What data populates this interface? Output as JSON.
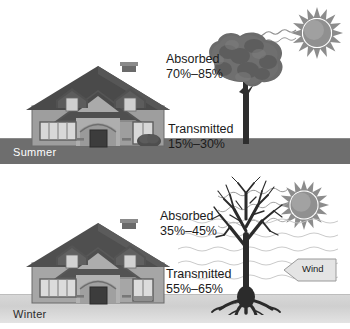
{
  "figure": {
    "type": "illustration"
  },
  "panels": [
    {
      "id": "summer",
      "season_label": "Summer",
      "ground_color": "#6e6e6e",
      "season_label_color": "#ffffff",
      "tree_state": "leafed",
      "callouts": [
        {
          "name": "absorbed",
          "line1": "Absorbed",
          "line2": "70%–85%"
        },
        {
          "name": "transmitted",
          "line1": "Transmitted",
          "line2": "15%–30%"
        }
      ],
      "sun": {
        "name": "sun-icon",
        "color": "#8c8c8c"
      },
      "shrub": true,
      "wind": null
    },
    {
      "id": "winter",
      "season_label": "Winter",
      "ground_color": "#d4d4d4",
      "season_label_color": "#2b2b2b",
      "tree_state": "bare",
      "callouts": [
        {
          "name": "absorbed",
          "line1": "Absorbed",
          "line2": "35%–45%"
        },
        {
          "name": "transmitted",
          "line1": "Transmitted",
          "line2": "55%–65%"
        }
      ],
      "sun": {
        "name": "sun-icon",
        "color": "#8c8c8c"
      },
      "shrub": false,
      "wind": {
        "label": "Wind",
        "direction": "left"
      }
    }
  ],
  "colors": {
    "roof": "#4a4a4a",
    "roof_light": "#5a5a5a",
    "wall": "#9e9e9e",
    "wall_light": "#b0b0b0",
    "window": "#d8d8d8",
    "door": "#3c3c3c",
    "tree_canopy": "#6b6b6b",
    "tree_trunk": "#2e2e2e",
    "sun": "#8c8c8c",
    "text": "#1b1b1b",
    "background": "#ffffff"
  }
}
